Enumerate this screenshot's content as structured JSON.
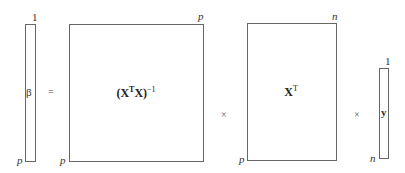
{
  "diagram": {
    "type": "matrix-equation",
    "equation": "β = (XᵀX)⁻¹ × Xᵀ × y",
    "matrices": [
      {
        "id": "beta",
        "label": "β",
        "rows_label": "p",
        "cols_label": "1"
      },
      {
        "id": "xtx-inverse",
        "label_main": "(X",
        "label_sup1": "T",
        "label_mid": "X)",
        "label_sup2": "−1",
        "rows_label": "p",
        "cols_label": "p"
      },
      {
        "id": "x-transpose",
        "label_main": "X",
        "label_sup": "T",
        "rows_label": "p",
        "cols_label": "n"
      },
      {
        "id": "y",
        "label": "y",
        "rows_label": "n",
        "cols_label": "1"
      }
    ],
    "operators": [
      "=",
      "×",
      "×"
    ]
  }
}
